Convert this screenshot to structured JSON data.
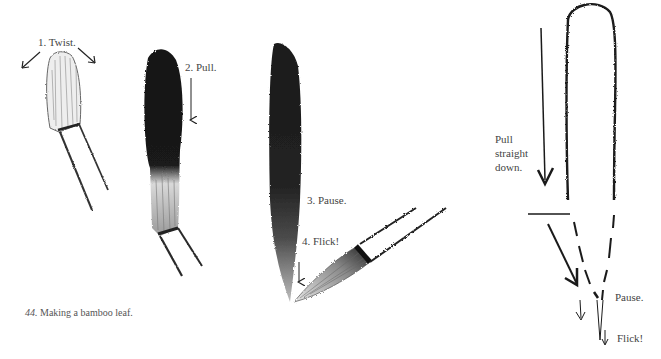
{
  "figure": {
    "caption_number": "44.",
    "caption_text": "Making a bamboo leaf."
  },
  "steps": [
    {
      "label": "1. Twist."
    },
    {
      "label": "2. Pull."
    },
    {
      "label": "3. Pause."
    },
    {
      "label": "4. Flick!"
    }
  ],
  "outline_diagram": {
    "pull_label_line1": "Pull",
    "pull_label_line2": "straight",
    "pull_label_line3": "down.",
    "pause_label": "Pause.",
    "flick_label": "Flick!"
  },
  "colors": {
    "ink": "#111111",
    "paper": "#ffffff",
    "text": "#444444"
  }
}
